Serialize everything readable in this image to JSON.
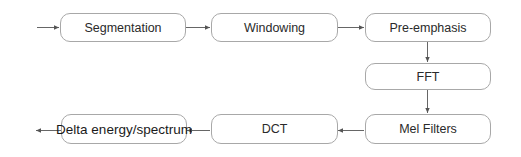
{
  "diagram": {
    "title": "",
    "nodes": [
      {
        "id": "segmentation",
        "label": "Segmentation"
      },
      {
        "id": "windowing",
        "label": "Windowing"
      },
      {
        "id": "pre-emphasis",
        "label": "Pre-emphasis"
      },
      {
        "id": "fft",
        "label": "FFT"
      },
      {
        "id": "mel-filters",
        "label": "Mel Filters"
      },
      {
        "id": "dct",
        "label": "DCT"
      },
      {
        "id": "delta",
        "label": "Delta energy/spectrum"
      }
    ],
    "edges": [
      {
        "from": "input",
        "to": "segmentation"
      },
      {
        "from": "segmentation",
        "to": "windowing"
      },
      {
        "from": "windowing",
        "to": "pre-emphasis"
      },
      {
        "from": "pre-emphasis",
        "to": "fft"
      },
      {
        "from": "fft",
        "to": "mel-filters"
      },
      {
        "from": "mel-filters",
        "to": "dct"
      },
      {
        "from": "dct",
        "to": "delta"
      },
      {
        "from": "delta",
        "to": "output"
      }
    ],
    "colors": {
      "border": "#a8a8a8",
      "arrow": "#555555",
      "text": "#2a2a2a"
    }
  }
}
